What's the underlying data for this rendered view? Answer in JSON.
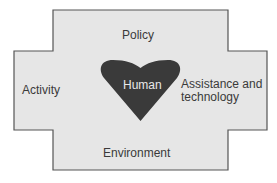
{
  "diagram": {
    "center": {
      "label": "Human",
      "shape": "heart-icon",
      "fill": "#3a3a3a"
    },
    "regions": {
      "top": "Policy",
      "left": "Activity",
      "right_line1": "Assistance and",
      "right_line2": "technology",
      "bottom": "Environment"
    },
    "colors": {
      "background": "#e6e6e6",
      "border": "#555555",
      "text": "#3a3a3a"
    }
  }
}
